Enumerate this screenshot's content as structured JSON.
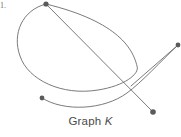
{
  "figure": {
    "item_number": "1.",
    "caption_prefix": "Graph",
    "caption_name": "K",
    "stroke_color": "#6b6b6b",
    "vertex_color": "#5a5a5a",
    "background_color": "#ffffff"
  },
  "chart_data": {
    "type": "diagram",
    "title": "Graph K",
    "diagram_kind": "undirected-multigraph-drawing",
    "xlabel": "",
    "ylabel": "",
    "xlim": [
      0,
      181
    ],
    "ylim": [
      0,
      137
    ],
    "grid": false,
    "legend": "none",
    "vertices": [
      {
        "id": "A",
        "x": 46,
        "y": 4,
        "radius": 2.6
      },
      {
        "id": "B",
        "x": 178,
        "y": 45,
        "radius": 2.4
      },
      {
        "id": "C",
        "x": 42,
        "y": 98,
        "radius": 2.4
      },
      {
        "id": "D",
        "x": 153,
        "y": 112,
        "radius": 2.8
      }
    ],
    "edges": [
      {
        "id": "e1",
        "from": "A",
        "to": "A",
        "kind": "loop",
        "note": "large ellipse loop leaving top vertex, sweeping left and down, bottom near (110,78), returning up the right side to (137,66) then back up to the top vertex",
        "path": "M 46 4 C 22 10 12 34 20 56 C 28 80 62 96 98 90 C 124 86 140 74 137 66 C 133 50 120 22 46 4"
      },
      {
        "id": "e2",
        "from": "A",
        "to": "D",
        "kind": "line",
        "note": "straight edge from the top vertex down to the bottom-right vertex",
        "path": "M 46 4 L 153 112"
      },
      {
        "id": "e3",
        "from": "B",
        "to": "D",
        "kind": "line",
        "note": "straight edge from the right vertex down-left to the bottom-right vertex region",
        "path": "M 178 45 L 131 86"
      },
      {
        "id": "e4",
        "from": "C",
        "to": "B",
        "kind": "curve",
        "note": "curve from the bottom-left vertex sweeping right along the bottom then up to the right vertex",
        "path": "M 42 98 C 64 112 104 110 127 93 C 142 82 160 62 178 45"
      }
    ],
    "crossings": [
      {
        "x": 131,
        "y": 73
      },
      {
        "x": 136,
        "y": 87
      },
      {
        "x": 124,
        "y": 64
      }
    ],
    "vertex_count": 4,
    "edge_count": 4
  }
}
